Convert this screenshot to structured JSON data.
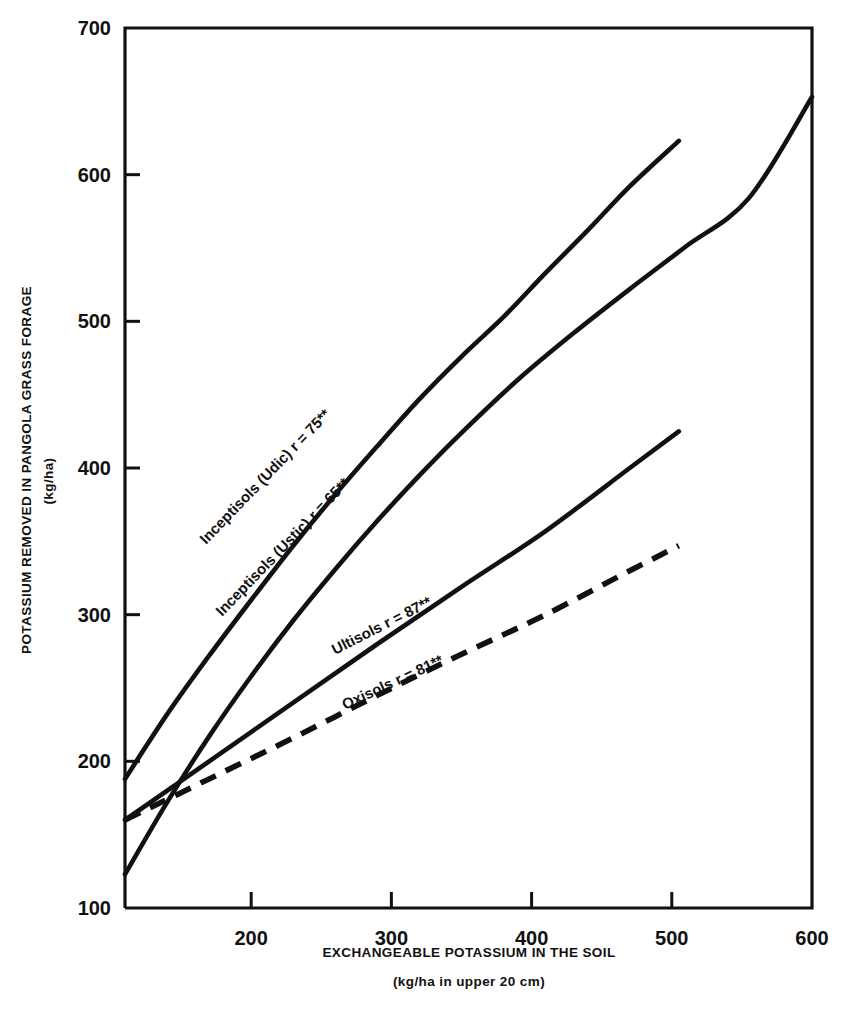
{
  "chart_data": {
    "type": "line",
    "title": "",
    "xlabel": "EXCHANGEABLE POTASSIUM IN THE SOIL",
    "xlabel_sub": "(kg/ha in upper 20 cm)",
    "ylabel": "POTASSIUM REMOVED IN PANGOLA GRASS FORAGE",
    "ylabel_sub": "(kg/ha)",
    "xlim": [
      110,
      600
    ],
    "ylim": [
      100,
      700
    ],
    "xticks": [
      200,
      300,
      400,
      500,
      600
    ],
    "yticks": [
      100,
      200,
      300,
      400,
      500,
      600,
      700
    ],
    "xtick_labels": [
      "200",
      "300",
      "400",
      "500",
      "600"
    ],
    "ytick_labels": [
      "100",
      "200",
      "300",
      "400",
      "500",
      "600",
      "700"
    ],
    "grid": false,
    "legend_position": "inline-curve-labels",
    "series": [
      {
        "name": "Inceptisols (Udic)",
        "label": "Inceptisols (Udic) r = 75**",
        "r": "75**",
        "style": "solid",
        "x": [
          110,
          140,
          170,
          200,
          230,
          260,
          290,
          320,
          350,
          380,
          410,
          440,
          470,
          505
        ],
        "y": [
          188,
          232,
          272,
          310,
          347,
          382,
          415,
          447,
          476,
          503,
          533,
          562,
          592,
          623
        ]
      },
      {
        "name": "Inceptisols (Ustic)",
        "label": "Inceptisols (Ustic) r = 65**",
        "r": "65**",
        "style": "solid",
        "x": [
          110,
          140,
          170,
          200,
          230,
          260,
          290,
          320,
          350,
          390,
          430,
          470,
          510,
          555,
          600
        ],
        "y": [
          123,
          172,
          217,
          258,
          296,
          331,
          364,
          395,
          424,
          460,
          492,
          522,
          551,
          584,
          653
        ]
      },
      {
        "name": "Ultisols",
        "label": "Ultisols r = 87**",
        "r": "87**",
        "style": "solid",
        "x": [
          110,
          170,
          230,
          290,
          350,
          410,
          470,
          505
        ],
        "y": [
          160,
          200,
          240,
          280,
          319,
          357,
          400,
          425
        ]
      },
      {
        "name": "Oxisols",
        "label": "Oxisols r = 81**",
        "r": "81**",
        "style": "dashed",
        "x": [
          110,
          170,
          230,
          290,
          350,
          410,
          470,
          505
        ],
        "y": [
          160,
          188,
          216,
          245,
          273,
          300,
          330,
          347
        ]
      }
    ]
  },
  "axis": {
    "x_title": "EXCHANGEABLE POTASSIUM IN THE SOIL",
    "x_subtitle": "(kg/ha in upper 20 cm)",
    "y_title": "POTASSIUM REMOVED IN PANGOLA GRASS FORAGE",
    "y_subtitle": "(kg/ha)"
  },
  "colors": {
    "ink": "#111111",
    "background": "#ffffff"
  }
}
